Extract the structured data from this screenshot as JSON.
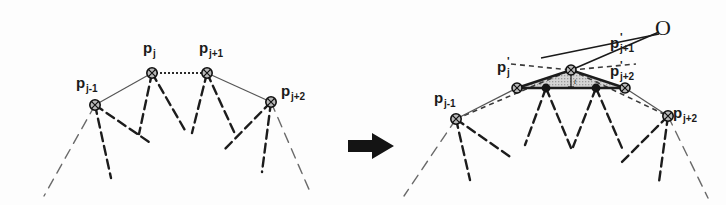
{
  "figure": {
    "background_color": "#fdfdfd",
    "ink_color": "#1a1a1a",
    "shade_color": "#c9c9c9",
    "width": 726,
    "height": 205
  },
  "arrow": {
    "name": "transformation-arrow",
    "direction": "right",
    "color": "#141414"
  },
  "left_panel": {
    "caption": "before",
    "labels": [
      {
        "id": "p_j_minus_1",
        "base": "p",
        "sub": "j-1",
        "prime": "",
        "x": 76,
        "y": 88
      },
      {
        "id": "p_j",
        "base": "p",
        "sub": "j",
        "prime": "",
        "x": 143,
        "y": 53
      },
      {
        "id": "p_j_plus_1",
        "base": "p",
        "sub": "j+1",
        "prime": "",
        "x": 199,
        "y": 53
      },
      {
        "id": "p_j_plus_2",
        "base": "p",
        "sub": "j+2",
        "prime": "",
        "x": 281,
        "y": 96
      }
    ],
    "nodes": [
      {
        "id": "p_j_minus_1",
        "x": 95,
        "y": 105
      },
      {
        "id": "p_j",
        "x": 152,
        "y": 73
      },
      {
        "id": "p_j_plus_1",
        "x": 207,
        "y": 73
      },
      {
        "id": "p_j_plus_2",
        "x": 271,
        "y": 102
      }
    ],
    "edges": [
      {
        "kind": "thin",
        "from": "p_j_minus_1",
        "to": "p_j"
      },
      {
        "kind": "dotted",
        "from": "p_j",
        "to": "p_j_plus_1"
      },
      {
        "kind": "thin",
        "from": "p_j_plus_1",
        "to": "p_j_plus_2"
      }
    ]
  },
  "right_panel": {
    "caption": "after",
    "center_label": {
      "id": "O",
      "text": "O",
      "x": 666,
      "y": 27
    },
    "thickness_label": {
      "id": "t",
      "text": "t",
      "x": 572,
      "y": 82
    },
    "labels": [
      {
        "id": "p_j_minus_1",
        "base": "p",
        "sub": "j-1",
        "prime": "",
        "x": 434,
        "y": 103
      },
      {
        "id": "p_prime_j",
        "base": "p",
        "sub": "j",
        "prime": "'",
        "x": 497,
        "y": 72
      },
      {
        "id": "p_prime_j_plus_1",
        "base": "p",
        "sub": "j+1",
        "prime": "'",
        "x": 610,
        "y": 48
      },
      {
        "id": "p_prime_j_plus_2",
        "base": "p",
        "sub": "j+2",
        "prime": "'",
        "x": 610,
        "y": 76
      },
      {
        "id": "p_j_plus_2",
        "base": "p",
        "sub": "j+2",
        "prime": "",
        "x": 673,
        "y": 118
      }
    ],
    "nodes": [
      {
        "id": "p_j_minus_1",
        "x": 456,
        "y": 119,
        "style": "ring"
      },
      {
        "id": "p_prime_j",
        "x": 517,
        "y": 88,
        "style": "ring"
      },
      {
        "id": "p_prime_j_plus_1",
        "x": 571,
        "y": 70,
        "style": "ring"
      },
      {
        "id": "p_prime_j_plus_2",
        "x": 625,
        "y": 88,
        "style": "ring"
      },
      {
        "id": "p_j_plus_2",
        "x": 668,
        "y": 116,
        "style": "ring"
      },
      {
        "id": "inner_left",
        "x": 546,
        "y": 88,
        "style": "dot"
      },
      {
        "id": "inner_right",
        "x": 596,
        "y": 88,
        "style": "dot"
      }
    ],
    "edges": [
      {
        "kind": "solid",
        "from": "p_prime_j",
        "to": "p_prime_j_plus_1"
      },
      {
        "kind": "solid",
        "from": "p_prime_j_plus_1",
        "to": "p_prime_j_plus_2"
      },
      {
        "kind": "solid",
        "from": "p_prime_j",
        "to": "p_prime_j_plus_2"
      },
      {
        "kind": "dashed",
        "from": "p_j_minus_1",
        "to": "p_prime_j_plus_1"
      },
      {
        "kind": "dashed",
        "from": "p_prime_j_plus_1",
        "to": "p_j_plus_2"
      },
      {
        "kind": "thin",
        "from": "p_j_minus_1",
        "to": "p_prime_j"
      },
      {
        "kind": "thin",
        "from": "p_prime_j_plus_2",
        "to": "p_j_plus_2"
      },
      {
        "kind": "leader",
        "from": "O",
        "to": "p_prime_j_plus_1"
      },
      {
        "kind": "leader",
        "from": "O",
        "to": "dashed_upper_left"
      }
    ],
    "shaded_triangle": {
      "id": "shaded-triangle",
      "vertices": [
        [
          517,
          88
        ],
        [
          571,
          70
        ],
        [
          625,
          88
        ]
      ],
      "fill": "#c9c9c9"
    }
  }
}
